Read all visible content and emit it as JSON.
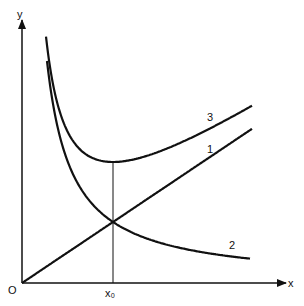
{
  "chart_data": {
    "type": "line",
    "title": "",
    "xlabel": "x",
    "ylabel": "y",
    "origin_label": "O",
    "marker_label": "x₀",
    "series": [
      {
        "name": "1",
        "label": "1",
        "description": "linear, y = k·x"
      },
      {
        "name": "2",
        "label": "2",
        "description": "decreasing, y = c/x"
      },
      {
        "name": "3",
        "label": "3",
        "description": "sum of 1 and 2, minimum at x₀"
      }
    ],
    "annotations": [
      "curves 1 and 2 intersect at x₀",
      "curve 3 has its minimum at x₀"
    ]
  }
}
